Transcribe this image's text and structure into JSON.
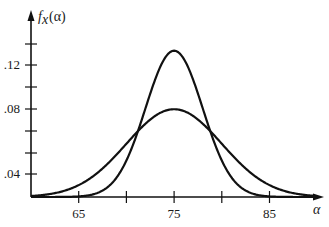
{
  "chart_data": {
    "type": "line",
    "title": "",
    "xlabel": "α",
    "ylabel": "f_x(α)",
    "ylabel_parts": {
      "f": "f",
      "sub": "x",
      "arg": "(α)"
    },
    "xlim": [
      60,
      90
    ],
    "x_ticks": [
      60,
      65,
      70,
      75,
      80,
      85
    ],
    "x_tick_labels": [
      {
        "value": 65,
        "label": "65"
      },
      {
        "value": 75,
        "label": "75"
      },
      {
        "value": 85,
        "label": "85"
      }
    ],
    "y_tick_pixels": [
      44,
      65,
      87,
      109,
      131,
      153,
      174
    ],
    "y_tick_labels": [
      {
        "label": ".12",
        "pixel": 65
      },
      {
        "label": ".08",
        "pixel": 109
      },
      {
        "label": ".04",
        "pixel": 174
      }
    ],
    "grid": false,
    "legend": null,
    "series": [
      {
        "name": "normal, mean 75, sd 5",
        "mu": 75,
        "sigma": 5,
        "peak": 0.08
      },
      {
        "name": "normal, mean 75, sd 3",
        "mu": 75,
        "sigma": 3,
        "peak": 0.133
      }
    ],
    "x": [
      60,
      62.5,
      65,
      67.5,
      70,
      72.5,
      75,
      77.5,
      80,
      82.5,
      85,
      87.5,
      90
    ],
    "values_sd5": [
      0.0009,
      0.0035,
      0.0108,
      0.0259,
      0.0484,
      0.0704,
      0.0798,
      0.0704,
      0.0484,
      0.0259,
      0.0108,
      0.0035,
      0.0009
    ],
    "values_sd3": [
      0.0,
      0.0,
      0.0005,
      0.0058,
      0.0332,
      0.094,
      0.133,
      0.094,
      0.0332,
      0.0058,
      0.0005,
      0.0,
      0.0
    ]
  }
}
